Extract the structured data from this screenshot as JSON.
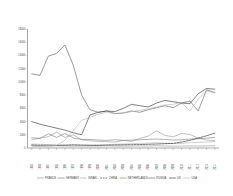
{
  "chart_data": {
    "type": "line",
    "title": "",
    "xlabel": "",
    "ylabel": "",
    "ylim": [
      0,
      18000
    ],
    "grid": false,
    "legend_position": "bottom",
    "ytick_labels": [
      "18000",
      "16000",
      "14000",
      "12000",
      "10000",
      "8000",
      "6000",
      "4000",
      "2000",
      "0"
    ],
    "ytick_values": [
      18000,
      16000,
      14000,
      12000,
      10000,
      8000,
      6000,
      4000,
      2000,
      0
    ],
    "categories": [
      "1992",
      "1993",
      "1994",
      "1995",
      "1996",
      "1997",
      "1998",
      "1999",
      "2000",
      "2001",
      "2002",
      "2003",
      "2004",
      "2005",
      "2006",
      "2007",
      "2008",
      "2009",
      "2010",
      "2011",
      "2012",
      "2013",
      "2014"
    ],
    "series": [
      {
        "name": "FRANCE",
        "color": "#8c8c8c",
        "style": "solid",
        "width": 0.55,
        "values": [
          1250,
          1500,
          1700,
          2400,
          1600,
          2000,
          1250,
          1100,
          1000,
          950,
          900,
          1150,
          1000,
          1450,
          1800,
          2600,
          1900,
          1700,
          2200,
          2050,
          1500,
          1200,
          1100
        ]
      },
      {
        "name": "GERMANY",
        "color": "#6e6e6e",
        "style": "solid",
        "width": 0.55,
        "values": [
          1550,
          1450,
          2150,
          1600,
          2200,
          1500,
          1300,
          1300,
          1200,
          1150,
          1250,
          1150,
          1200,
          1250,
          1300,
          1350,
          1300,
          1200,
          1250,
          1350,
          1400,
          1500,
          1600
        ]
      },
      {
        "name": "ISRAEL",
        "color": "#a0a0a0",
        "style": "solid",
        "width": 0.5,
        "values": [
          600,
          550,
          500,
          480,
          500,
          520,
          480,
          450,
          500,
          520,
          560,
          600,
          650,
          700,
          750,
          800,
          700,
          650,
          700,
          800,
          850,
          900,
          950
        ]
      },
      {
        "name": "CHINA",
        "color": "#2b2b2b",
        "style": "dashed",
        "width": 0.65,
        "values": [
          450,
          400,
          420,
          380,
          400,
          450,
          420,
          400,
          380,
          420,
          450,
          480,
          500,
          520,
          560,
          600,
          650,
          700,
          900,
          1150,
          1500,
          1850,
          2250
        ]
      },
      {
        "name": "NETHERLANDS",
        "color": "#7a7a7a",
        "style": "solid",
        "width": 0.5,
        "values": [
          350,
          330,
          300,
          320,
          300,
          280,
          300,
          280,
          300,
          320,
          300,
          280,
          300,
          320,
          300,
          330,
          300,
          280,
          300,
          320,
          300,
          330,
          350
        ]
      },
      {
        "name": "RUSSIA",
        "color": "#555555",
        "style": "solid",
        "width": 0.6,
        "values": [
          11200,
          11000,
          13900,
          14300,
          15600,
          12500,
          8000,
          5800,
          5400,
          5600,
          5200,
          5300,
          5600,
          5400,
          5800,
          6100,
          6400,
          6100,
          6800,
          7100,
          5600,
          8800,
          8400
        ]
      },
      {
        "name": "UK",
        "color": "#3a3a3a",
        "style": "solid",
        "width": 0.65,
        "values": [
          4000,
          3600,
          3300,
          3000,
          2700,
          2300,
          2000,
          5000,
          5400,
          5600,
          5500,
          6000,
          6600,
          6400,
          6200,
          6800,
          7200,
          7000,
          6800,
          6700,
          8200,
          9000,
          8900
        ]
      },
      {
        "name": "USA",
        "color": "#b0b0b0",
        "style": "solid",
        "width": 0.6,
        "values": [
          200,
          250,
          300,
          400,
          1200,
          2600,
          4200,
          4600,
          5100,
          5400,
          5200,
          5300,
          5500,
          5700,
          5900,
          6200,
          6500,
          6600,
          6900,
          5600,
          7400,
          8600,
          8400
        ]
      }
    ]
  }
}
